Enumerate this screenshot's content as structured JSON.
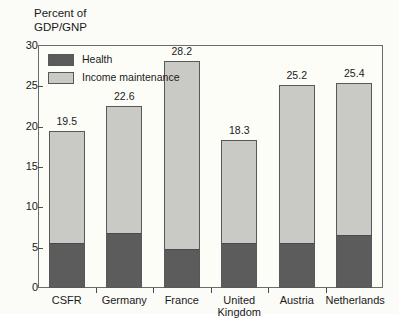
{
  "chart_data": {
    "type": "bar",
    "subtype": "stacked-vertical",
    "title": "",
    "ylabel": "Percent of\nGDP/GNP",
    "xlabel": "",
    "ylim": [
      0,
      30
    ],
    "yticks": [
      0,
      5,
      10,
      15,
      20,
      25,
      30
    ],
    "grid": false,
    "legend_position": "inside-top-left",
    "categories": [
      "CSFR",
      "Germany",
      "France",
      "United\nKingdom",
      "Austria",
      "Netherlands"
    ],
    "totals": [
      19.5,
      22.6,
      28.2,
      18.3,
      25.2,
      25.4
    ],
    "total_labels": [
      "19.5",
      "22.6",
      "28.2",
      "18.3",
      "25.2",
      "25.4"
    ],
    "series": [
      {
        "name": "Health",
        "color": "#5c5c5c",
        "values": [
          5.5,
          6.7,
          4.7,
          5.5,
          5.4,
          6.4
        ]
      },
      {
        "name": "Income maintenance",
        "color": "#c9c9c5",
        "values": [
          14.0,
          15.9,
          23.5,
          12.8,
          19.8,
          19.0
        ]
      }
    ]
  },
  "legend": {
    "items": [
      {
        "label": "Health",
        "color": "#5c5c5c"
      },
      {
        "label": "Income maintenance",
        "color": "#c9c9c5"
      }
    ]
  },
  "axis": {
    "y_title": "Percent of\nGDP/GNP",
    "y_tick_labels": [
      "30",
      "25",
      "20",
      "15",
      "10",
      "5",
      "0"
    ]
  }
}
